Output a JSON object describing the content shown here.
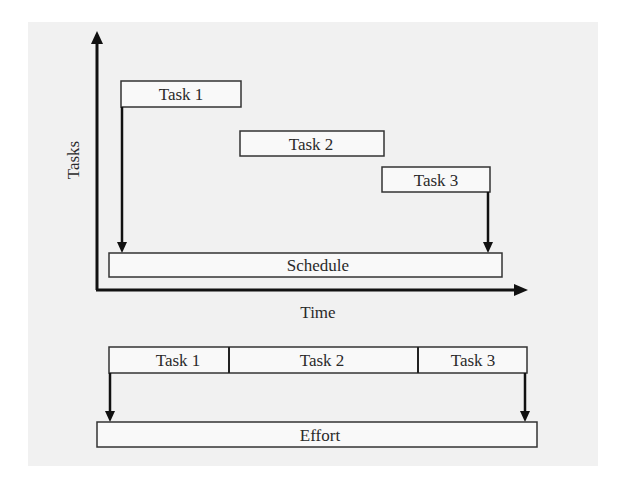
{
  "diagram": {
    "upper": {
      "y_axis_label": "Tasks",
      "x_axis_label": "Time",
      "tasks": [
        {
          "label": "Task 1"
        },
        {
          "label": "Task 2"
        },
        {
          "label": "Task 3"
        }
      ],
      "schedule_label": "Schedule"
    },
    "lower": {
      "tasks": [
        {
          "label": "Task 1"
        },
        {
          "label": "Task 2"
        },
        {
          "label": "Task 3"
        }
      ],
      "effort_label": "Effort"
    },
    "colors": {
      "panel_bg": "#f1f1f1",
      "box_fill": "#f7f7f7",
      "stroke": "#333333",
      "axis": "#111111"
    }
  }
}
